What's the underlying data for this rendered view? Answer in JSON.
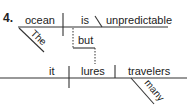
{
  "item_number": "4.",
  "clause1": {
    "subject": "ocean",
    "verb": "is",
    "predicate_adjective": "unpredictable",
    "subject_modifier": "The"
  },
  "conjunction": "but",
  "clause2": {
    "subject": "it",
    "verb": "lures",
    "direct_object": "travelers",
    "object_modifier": "many"
  },
  "colors": {
    "line": "#333333",
    "text": "#222222",
    "background": "#ffffff"
  }
}
